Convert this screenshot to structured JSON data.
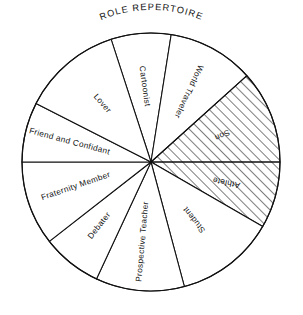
{
  "chart_data": {
    "type": "pie",
    "title": "ROLE REPERTOIRE",
    "xlabel": "",
    "ylabel": "",
    "legend": "none",
    "grid": false,
    "center": {
      "cx": 151,
      "cy": 162,
      "r": 129
    },
    "note": "Angles in degrees measured clockwise from 12 o'clock. Hatched slices are diagonally shaded.",
    "categories": [
      "Cartoonist",
      "World Traveler",
      "Son",
      "Athlete",
      "Student",
      "Prospective Teacher",
      "Debater",
      "Fraternity Member",
      "Friend and Confidant",
      "Lover"
    ],
    "values": [
      27,
      39,
      42,
      30,
      45,
      40,
      27,
      38,
      27,
      45
    ],
    "unit": "degrees",
    "slices": [
      {
        "label": "Cartoonist",
        "start": 342,
        "end": 369,
        "sweep": 27,
        "hatched": false,
        "label_angle": 355,
        "label_radius": 76,
        "text_rotation": 82
      },
      {
        "label": "World Traveler",
        "start": 9,
        "end": 48,
        "sweep": 39,
        "hatched": false,
        "label_angle": 28,
        "label_radius": 80,
        "text_rotation": 115
      },
      {
        "label": "Son",
        "start": 48,
        "end": 90,
        "sweep": 42,
        "hatched": true,
        "label_angle": 69,
        "label_radius": 76,
        "text_rotation": 156
      },
      {
        "label": "Athlete",
        "start": 90,
        "end": 120,
        "sweep": 30,
        "hatched": true,
        "label_angle": 105,
        "label_radius": 78,
        "text_rotation": 192
      },
      {
        "label": "Student",
        "start": 120,
        "end": 165,
        "sweep": 45,
        "hatched": false,
        "label_angle": 143,
        "label_radius": 72,
        "text_rotation": 232
      },
      {
        "label": "Prospective Teacher",
        "start": 165,
        "end": 205,
        "sweep": 40,
        "hatched": false,
        "label_angle": 186,
        "label_radius": 80,
        "text_rotation": 275
      },
      {
        "label": "Debater",
        "start": 205,
        "end": 232,
        "sweep": 27,
        "hatched": false,
        "label_angle": 219,
        "label_radius": 82,
        "text_rotation": 308
      },
      {
        "label": "Fraternity Member",
        "start": 232,
        "end": 270,
        "sweep": 38,
        "hatched": false,
        "label_angle": 252,
        "label_radius": 79,
        "text_rotation": 341
      },
      {
        "label": "Friend and Confidant",
        "start": 270,
        "end": 297,
        "sweep": 27,
        "hatched": false,
        "label_angle": 284,
        "label_radius": 84,
        "text_rotation": 15
      },
      {
        "label": "Lover",
        "start": 297,
        "end": 342,
        "sweep": 45,
        "hatched": false,
        "label_angle": 320,
        "label_radius": 76,
        "text_rotation": 49
      }
    ],
    "colors": {
      "stroke": "#111111",
      "fill": "#ffffff",
      "hatch": "#111111",
      "background": "#ffffff"
    }
  }
}
